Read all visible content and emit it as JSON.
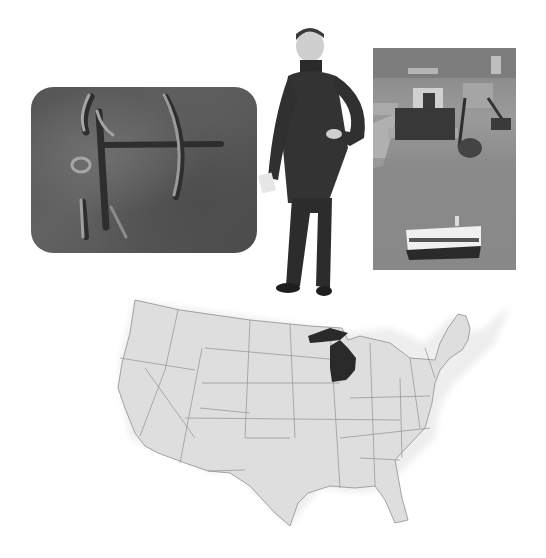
{
  "composition": {
    "description": "Grayscale collage of four images related to Michigan",
    "colors": {
      "background": "#ffffff",
      "stone": "#5a5a5a",
      "carving_highlight": "#9a9a9a",
      "map_fill": "#dcdcdc",
      "map_border": "#8a8a8a",
      "highlight_state": "#2a2a2a",
      "water": "#8c8c8c"
    }
  },
  "images": [
    {
      "id": "petroglyph",
      "subject": "rock carving of archer with bow"
    },
    {
      "id": "portrait",
      "subject": "19th-century man in frock coat, hand on hip"
    },
    {
      "id": "ship-photo",
      "subject": "freighter in canal locks with tour boat"
    },
    {
      "id": "us-map",
      "subject": "map of contiguous United States",
      "highlighted_state": "Michigan"
    }
  ]
}
